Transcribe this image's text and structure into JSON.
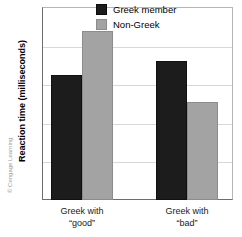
{
  "chart_data": {
    "type": "bar",
    "title": "",
    "xlabel": "",
    "ylabel": "Reaction time (milliseconds)",
    "categories": [
      "Greek with\n“good”",
      "Greek with\n“bad”"
    ],
    "series": [
      {
        "name": "Greek member",
        "color": "#1c1c1c",
        "values": [
          825,
          860
        ]
      },
      {
        "name": "Non-Greek",
        "color": "#a3a3a3",
        "values": [
          937,
          755
        ]
      }
    ],
    "ylim": [
      500,
      1000
    ],
    "yticks": [
      1000,
      900,
      800,
      700,
      600,
      500
    ],
    "ytick_labels": [
      "1000",
      "900",
      "800",
      "700",
      "600",
      "500"
    ],
    "grid": true,
    "legend_position": "top-right-inside"
  },
  "legend": {
    "items": [
      {
        "label": "Greek member",
        "color": "#1c1c1c"
      },
      {
        "label": "Non-Greek",
        "color": "#a3a3a3"
      }
    ]
  },
  "axis": {
    "y_title": "Reaction time (milliseconds)",
    "tick_labels": [
      "1000",
      "900",
      "800",
      "700",
      "600",
      "500"
    ],
    "category_labels": [
      "Greek with\n“good”",
      "Greek with\n“bad”"
    ]
  },
  "footer": {
    "copyright": "© Cengage Learning"
  }
}
